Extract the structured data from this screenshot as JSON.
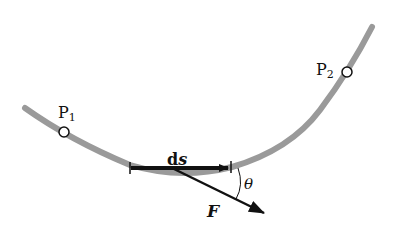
{
  "figure": {
    "path": {
      "color": "#9a9a9a",
      "width": 6,
      "d": "M 25 108 Q 70 140 130 165 Q 180 180 232 167 Q 290 150 320 110 Q 350 70 372 27"
    },
    "points": [
      {
        "name": "P",
        "subscript": "1",
        "x": 64,
        "y": 132,
        "label_x": 58,
        "label_y": 103
      },
      {
        "name": "P",
        "subscript": "2",
        "x": 347,
        "y": 72,
        "label_x": 316,
        "label_y": 60
      }
    ],
    "ds": {
      "label": "d",
      "label_bold": "s",
      "x1": 130,
      "y1": 168,
      "x2": 230,
      "y2": 168,
      "label_x": 168,
      "label_y": 152
    },
    "force": {
      "label": "F",
      "x1": 172,
      "y1": 168,
      "x2": 266,
      "y2": 214,
      "label_x": 208,
      "label_y": 203
    },
    "angle": {
      "label": "θ",
      "label_x": 244,
      "label_y": 177
    },
    "stroke_color": "#111111"
  }
}
